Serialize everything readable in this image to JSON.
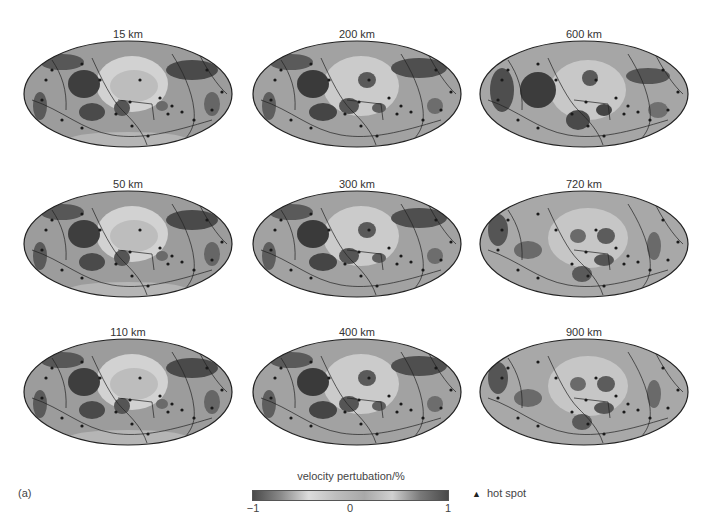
{
  "figure": {
    "tag": "(a)",
    "panels": [
      {
        "label": "15 km",
        "depth_km": 15,
        "row": 0,
        "col": 0
      },
      {
        "label": "200 km",
        "depth_km": 200,
        "row": 0,
        "col": 1
      },
      {
        "label": "600 km",
        "depth_km": 600,
        "row": 0,
        "col": 2
      },
      {
        "label": "50 km",
        "depth_km": 50,
        "row": 1,
        "col": 0
      },
      {
        "label": "300 km",
        "depth_km": 300,
        "row": 1,
        "col": 1
      },
      {
        "label": "720 km",
        "depth_km": 720,
        "row": 1,
        "col": 2
      },
      {
        "label": "110 km",
        "depth_km": 110,
        "row": 2,
        "col": 0
      },
      {
        "label": "400 km",
        "depth_km": 400,
        "row": 2,
        "col": 1
      },
      {
        "label": "900 km",
        "depth_km": 900,
        "row": 2,
        "col": 2
      }
    ],
    "projection": "Hammer/Mollweide global, Pacific-centred",
    "colorbar": {
      "title": "velocity pertubation/%",
      "ticks": [
        "−1",
        "0",
        "1"
      ],
      "range": [
        -1,
        1
      ],
      "colors": [
        "#4a4a4a",
        "#8a8a8a",
        "#dcdcdc",
        "#bdbdbd",
        "#a8a8a8",
        "#d0d0d0",
        "#7a7a7a",
        "#4a4a4a"
      ]
    },
    "legend": {
      "hotspot_symbol": "▲",
      "hotspot_label": "hot spot"
    },
    "caption_partial": "Figure 4.1(a) ... (caption clipped at bottom edge)"
  }
}
